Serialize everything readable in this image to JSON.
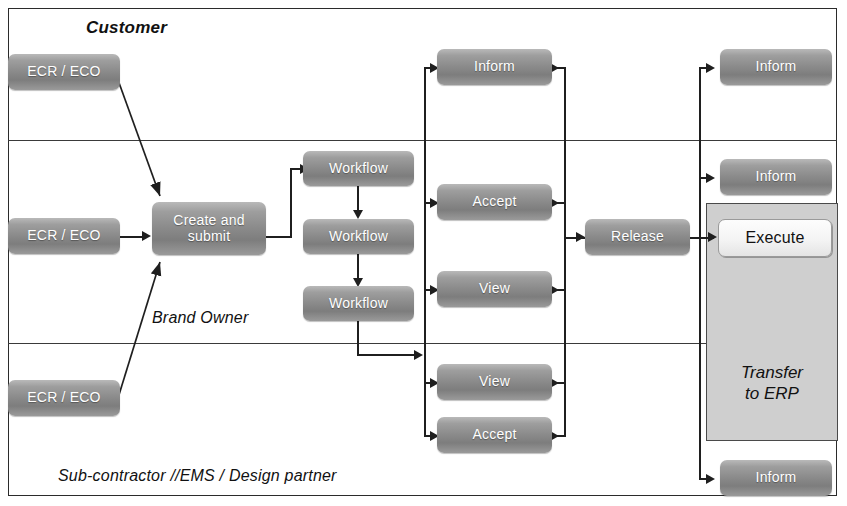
{
  "diagram": {
    "lanes": [
      {
        "id": "customer",
        "label": "Customer"
      },
      {
        "id": "brand",
        "label": "Brand Owner"
      },
      {
        "id": "subcontractor",
        "label": "Sub-contractor //EMS / Design partner"
      }
    ],
    "nodes": {
      "ecr_customer": {
        "label": "ECR / ECO"
      },
      "ecr_brand": {
        "label": "ECR / ECO"
      },
      "ecr_sub": {
        "label": "ECR / ECO"
      },
      "create_submit": {
        "label": "Create and submit"
      },
      "workflow_1": {
        "label": "Workflow"
      },
      "workflow_2": {
        "label": "Workflow"
      },
      "workflow_3": {
        "label": "Workflow"
      },
      "inform_customer": {
        "label": "Inform"
      },
      "accept_brand": {
        "label": "Accept"
      },
      "view_brand": {
        "label": "View"
      },
      "view_sub": {
        "label": "View"
      },
      "accept_sub": {
        "label": "Accept"
      },
      "release": {
        "label": "Release"
      },
      "inform_top": {
        "label": "Inform"
      },
      "inform_mid": {
        "label": "Inform"
      },
      "execute": {
        "label": "Execute"
      },
      "transfer_erp": {
        "label": "Transfer\nto ERP"
      },
      "inform_bottom": {
        "label": "Inform"
      }
    },
    "colors": {
      "node_fill_dark": "#8b8b8b",
      "node_text_light": "#ffffff",
      "node_fill_light": "#f4f4f4",
      "node_text_dark": "#111111",
      "erp_container": "#cfcfcf",
      "connector": "#1f1f1f",
      "frame_border": "#2b2b2b",
      "canvas_background": "#ffffff"
    }
  }
}
